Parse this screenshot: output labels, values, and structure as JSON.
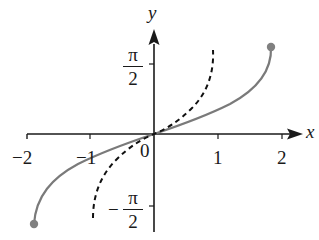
{
  "axes": {
    "x_label": "x",
    "y_label": "y",
    "x_ticks": [
      "-2",
      "-1",
      "0",
      "1",
      "2"
    ],
    "y_ticks": [
      {
        "sign": "",
        "num": "π",
        "den": "2"
      },
      {
        "sign": "−",
        "num": "π",
        "den": "2"
      }
    ],
    "x_tick_display": {
      "neg2": "−2",
      "neg1": "−1",
      "zero": "0",
      "one": "1",
      "two": "2"
    }
  },
  "colors": {
    "axis": "#1a1a1a",
    "solid_curve": "#7a7a7a",
    "dashed_curve": "#111111",
    "endpoint": "#808080"
  },
  "curves": [
    {
      "name": "solid-curve",
      "style": "solid",
      "x_range": [
        -1.85,
        1.85
      ],
      "endpoints": "closed dots"
    },
    {
      "name": "dashed-curve",
      "style": "dashed",
      "x_range": [
        -0.95,
        0.95
      ]
    }
  ]
}
